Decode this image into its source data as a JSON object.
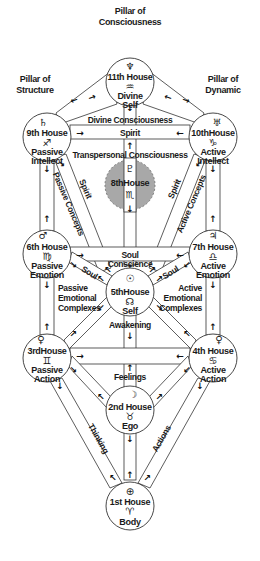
{
  "pillars": {
    "consciousness": [
      "Pillar of",
      "Consciousness"
    ],
    "structure": [
      "Pillar of",
      "Structure"
    ],
    "dynamic": [
      "Pillar of",
      "Dynamic"
    ]
  },
  "houses": {
    "h11": {
      "symbol": "♆",
      "name": "11th House",
      "sign": "♒",
      "l1": "Divine",
      "l2": "Self"
    },
    "h9": {
      "symbol": "♄",
      "name": "9th House",
      "sign": "♐",
      "l1": "Passive",
      "l2": "Intellect"
    },
    "h10": {
      "symbol": "♅",
      "name": "10thHouse",
      "sign": "♑",
      "l1": "Active",
      "l2": "Intellect"
    },
    "h8": {
      "symbol": "♇",
      "name": "8thHouse",
      "sign": "♏"
    },
    "h6": {
      "symbol": "♂",
      "name": "6th House",
      "sign": "♍",
      "l1": "Passive",
      "l2": "Emotion"
    },
    "h7": {
      "symbol": "♃",
      "name": "7th House",
      "sign": "♎",
      "l1": "Active",
      "l2": "Emotion"
    },
    "h5": {
      "symbol": "☉",
      "name": "5thHouse",
      "sign": "☊",
      "l1": "Self"
    },
    "h3": {
      "symbol": "♀",
      "name": "3rdHouse",
      "sign": "♊",
      "l1": "Passive",
      "l2": "Action"
    },
    "h4": {
      "symbol": "♀",
      "name": "4th House",
      "sign": "♋",
      "l1": "Active",
      "l2": "Action"
    },
    "h2": {
      "symbol": "☽",
      "name": "2nd House",
      "sign": "♉",
      "l1": "Ego"
    },
    "h1": {
      "symbol": "⊕",
      "name": "1st House",
      "sign": "♈",
      "l1": "Body"
    }
  },
  "paths": {
    "divine_consciousness": "Divine Consciousness",
    "spirit_horizontal": "Spirit",
    "transpersonal": "Transpersonal Consciousness",
    "spirit_left": "Spirit",
    "passive_concepts": "Passive Concepts",
    "spirit_right": "Spirit",
    "active_concepts": "Active Concepts",
    "soul_horizontal": "Soul",
    "soul_left": "Soul",
    "soul_right": "Soul",
    "conscience": "Conscience",
    "passive_emotional": [
      "Passive",
      "Emotional",
      "Complexes"
    ],
    "active_emotional": [
      "Active",
      "Emotional",
      "Complexes"
    ],
    "awakening": "Awakening",
    "feelings": "Feelings",
    "thinking": "Thinking",
    "actions": "Actions"
  },
  "colors": {
    "line": "#333333",
    "text": "#1a1a1a",
    "hidden_sephira": "#a8a8a8"
  }
}
